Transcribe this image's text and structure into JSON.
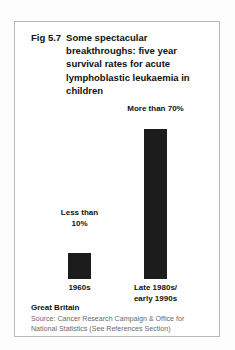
{
  "figure": {
    "number": "Fig 5.7",
    "title": "Some spectacular breakthroughs:  five year survival rates for acute lymphoblastic leukaemia in children",
    "region": "Great Britain",
    "source": "Source: Cancer Research Campaign & Office for National Statistics (See References Section)",
    "bar_color": "#1c1c1c",
    "frame_color": "#b9b9b9",
    "text_color": "#111111",
    "source_color": "#6a6a6a"
  },
  "chart_data": {
    "type": "bar",
    "title": "Some spectacular breakthroughs:  five year survival rates for acute lymphoblastic leukaemia in children",
    "xlabel": "",
    "ylabel": "",
    "ylim": [
      0,
      80
    ],
    "grid": false,
    "legend": "none",
    "categories": [
      "1960s",
      "Late 1980s/ early 1990s"
    ],
    "category_lines": [
      [
        "1960s"
      ],
      [
        "Late 1980s/",
        "early 1990s"
      ]
    ],
    "values": [
      10,
      70
    ],
    "value_labels": [
      "Less than 10%",
      "More than 70%"
    ],
    "value_label_lines": [
      [
        "Less",
        "than",
        "10%"
      ],
      [
        "More than",
        "70%"
      ]
    ],
    "annotations": [
      "Great Britain"
    ]
  }
}
